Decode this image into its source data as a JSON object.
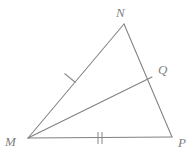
{
  "figure": {
    "background_color": "#ffffff",
    "stroke_color": "#808080",
    "label_color": "#808080",
    "width": 194,
    "height": 153
  },
  "points": {
    "M": {
      "label": "M",
      "x": 28,
      "y": 138,
      "label_x": 5,
      "label_y": 146
    },
    "N": {
      "label": "N",
      "x": 124,
      "y": 24,
      "label_x": 116,
      "label_y": 17
    },
    "P": {
      "label": "P",
      "x": 172,
      "y": 137,
      "label_x": 178,
      "label_y": 147
    },
    "Q": {
      "label": "Q",
      "x": 152,
      "y": 77,
      "label_x": 158,
      "label_y": 74
    }
  },
  "segments": [
    {
      "name": "MN",
      "from": "M",
      "to": "N",
      "x1": 28,
      "y1": 138,
      "x2": 124,
      "y2": 24
    },
    {
      "name": "NP",
      "from": "N",
      "to": "P",
      "x1": 124,
      "y1": 24,
      "x2": 172,
      "y2": 137
    },
    {
      "name": "MP",
      "from": "M",
      "to": "P",
      "x1": 28,
      "y1": 138,
      "x2": 172,
      "y2": 137
    },
    {
      "name": "MQ",
      "from": "M",
      "to": "Q",
      "x1": 28,
      "y1": 138,
      "x2": 152,
      "y2": 77
    }
  ],
  "tick_marks": [
    {
      "name": "tick-mn-single",
      "on_segment": "MN",
      "count": 1,
      "center_x": 70,
      "center_y": 78,
      "marks": [
        {
          "x1": 64.5,
          "y1": 73.5,
          "x2": 75.5,
          "y2": 82.5
        }
      ]
    },
    {
      "name": "tick-mp-double",
      "on_segment": "MP",
      "count": 2,
      "center_x": 100,
      "center_y": 138,
      "marks": [
        {
          "x1": 98,
          "y1": 132,
          "x2": 98,
          "y2": 144
        },
        {
          "x1": 102,
          "y1": 132,
          "x2": 102,
          "y2": 144
        }
      ]
    }
  ],
  "annotations": {
    "congruence_note_mn": "single tick",
    "congruence_note_mp": "double tick"
  }
}
